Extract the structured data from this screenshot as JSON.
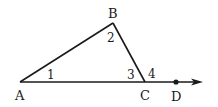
{
  "diagram": {
    "type": "geometry-triangle-exterior-angle",
    "points": {
      "A": {
        "label": "A",
        "x": 20,
        "y": 82
      },
      "B": {
        "label": "B",
        "x": 113,
        "y": 23
      },
      "C": {
        "label": "C",
        "x": 145,
        "y": 82
      },
      "D": {
        "label": "D",
        "x": 176,
        "y": 82
      }
    },
    "angles": [
      {
        "label": "1",
        "vertex": "A"
      },
      {
        "label": "2",
        "vertex": "B"
      },
      {
        "label": "3",
        "vertex": "C",
        "side": "interior"
      },
      {
        "label": "4",
        "vertex": "C",
        "side": "exterior"
      }
    ],
    "ray": {
      "from": "A",
      "through": "D",
      "arrow": true
    },
    "colors": {
      "stroke": "#1a1a1a",
      "background": "#ffffff"
    }
  }
}
